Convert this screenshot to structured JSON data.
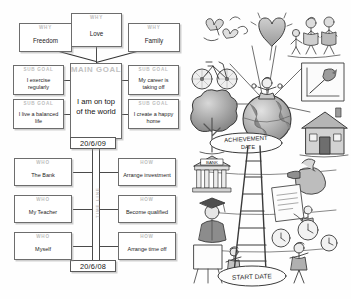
{
  "goal_map": {
    "why_boxes": [
      {
        "header": "WHY",
        "value": "Freedom"
      },
      {
        "header": "WHY",
        "value": "Love"
      },
      {
        "header": "WHY",
        "value": "Family"
      }
    ],
    "main_goal": {
      "header": "MAIN GOAL",
      "value": "I am on top of the world"
    },
    "sub_goals_left": [
      {
        "header": "SUB GOAL",
        "value": "I exercise regularly"
      },
      {
        "header": "SUB GOAL",
        "value": "I live a balanced life"
      }
    ],
    "sub_goals_right": [
      {
        "header": "SUB GOAL",
        "value": "My career is taking off"
      },
      {
        "header": "SUB GOAL",
        "value": "I create a happy home"
      }
    ],
    "achievement_date": "20/6/09",
    "start_date": "20/6/08",
    "timeline_label": "TIME LINE",
    "who_boxes": [
      {
        "header": "WHO",
        "value": "The Bank"
      },
      {
        "header": "WHO",
        "value": "My Teacher"
      },
      {
        "header": "WHO",
        "value": "Myself"
      }
    ],
    "how_boxes": [
      {
        "header": "HOW",
        "value": "Arrange investment"
      },
      {
        "header": "HOW",
        "value": "Become qualified"
      },
      {
        "header": "HOW",
        "value": "Arrange time off"
      }
    ]
  },
  "illustration": {
    "achievement_label": "ACHIEVEMENT DATE",
    "start_label": "START DATE",
    "bank_sign": "BANK",
    "elements": [
      "heart-balloon",
      "family-figures",
      "butterflies",
      "bicycle",
      "growth-chart",
      "tree",
      "globe",
      "house",
      "person-on-globe",
      "bank-building",
      "money-bag",
      "graduate-figure",
      "certificate-document",
      "easel-presenter",
      "clock-figure",
      "ladder"
    ]
  },
  "colors": {
    "ink": "#2b2b2b",
    "faint_header": "#bdbdbd",
    "box_border": "#6d6d6d",
    "paper": "#ffffff"
  }
}
